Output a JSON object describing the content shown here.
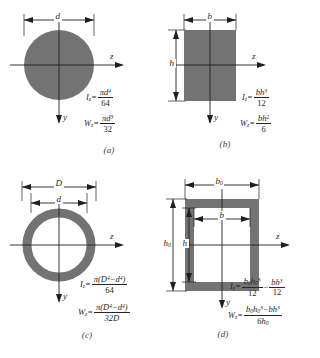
{
  "figure": {
    "fill_color": "#737373",
    "line_color": "#1f1f1f",
    "background_color": "#ffffff"
  },
  "panels": [
    {
      "id": "a",
      "caption": "(a)",
      "shape": "solid-circle",
      "dimensions": [
        {
          "name": "diameter",
          "label": "d",
          "orientation": "horizontal"
        }
      ],
      "axes": [
        {
          "name": "z-axis",
          "label": "z",
          "direction": "right"
        },
        {
          "name": "y-axis",
          "label": "y",
          "direction": "down"
        }
      ],
      "formulas": [
        {
          "name": "moment-of-inertia",
          "lhs": "I",
          "lhs_sub": "z",
          "numerator": "πd",
          "numerator_sup": "4",
          "denominator": "64"
        },
        {
          "name": "section-modulus",
          "lhs": "W",
          "lhs_sub": "z",
          "numerator": "πd",
          "numerator_sup": "3",
          "denominator": "32"
        }
      ]
    },
    {
      "id": "b",
      "caption": "(b)",
      "shape": "solid-rectangle",
      "dimensions": [
        {
          "name": "width",
          "label": "b",
          "orientation": "horizontal"
        },
        {
          "name": "height",
          "label": "h",
          "orientation": "vertical"
        }
      ],
      "axes": [
        {
          "name": "z-axis",
          "label": "z",
          "direction": "right"
        },
        {
          "name": "y-axis",
          "label": "y",
          "direction": "down"
        }
      ],
      "formulas": [
        {
          "name": "moment-of-inertia",
          "lhs": "I",
          "lhs_sub": "z",
          "numerator": "bh",
          "numerator_sup": "3",
          "denominator": "12"
        },
        {
          "name": "section-modulus",
          "lhs": "W",
          "lhs_sub": "z",
          "numerator": "bh",
          "numerator_sup": "2",
          "denominator": "6"
        }
      ]
    },
    {
      "id": "c",
      "caption": "(c)",
      "shape": "hollow-circle",
      "dimensions": [
        {
          "name": "outer-diameter",
          "label": "D",
          "orientation": "horizontal"
        },
        {
          "name": "inner-diameter",
          "label": "d",
          "orientation": "horizontal"
        }
      ],
      "axes": [
        {
          "name": "z-axis",
          "label": "z",
          "direction": "right"
        },
        {
          "name": "y-axis",
          "label": "y",
          "direction": "down"
        }
      ],
      "formulas": [
        {
          "name": "moment-of-inertia",
          "lhs": "I",
          "lhs_sub": "z",
          "numerator_parts": [
            "π(D",
            "4",
            "−d",
            "4",
            ")"
          ],
          "denominator": "64"
        },
        {
          "name": "section-modulus",
          "lhs": "W",
          "lhs_sub": "z",
          "numerator_parts": [
            "π(D",
            "4",
            "−d",
            "4",
            ")"
          ],
          "denominator": "32D"
        }
      ]
    },
    {
      "id": "d",
      "caption": "(d)",
      "shape": "hollow-rectangle",
      "dimensions": [
        {
          "name": "outer-width",
          "label": "b",
          "label_sub": "0",
          "orientation": "horizontal"
        },
        {
          "name": "inner-width",
          "label": "b",
          "orientation": "horizontal"
        },
        {
          "name": "outer-height",
          "label": "h",
          "label_sub": "0",
          "orientation": "vertical"
        },
        {
          "name": "inner-height",
          "label": "h",
          "orientation": "vertical"
        }
      ],
      "axes": [
        {
          "name": "z-axis",
          "label": "z",
          "direction": "right"
        },
        {
          "name": "y-axis",
          "label": "y",
          "direction": "down"
        }
      ],
      "formulas": [
        {
          "name": "moment-of-inertia",
          "lhs": "I",
          "lhs_sub": "z",
          "term1_num": "b",
          "term1_num_sub": "0",
          "term1_num2": "h",
          "term1_num2_sub": "0",
          "term1_num2_sup": "3",
          "term1_den": "12",
          "operator": "−",
          "term2_num": "bh",
          "term2_num_sup": "3",
          "term2_den": "12"
        },
        {
          "name": "section-modulus",
          "lhs": "W",
          "lhs_sub": "z",
          "numerator_b0": "b",
          "numerator_b0_sub": "0",
          "numerator_h0": "h",
          "numerator_h0_sub": "0",
          "numerator_h0_sup": "3",
          "numerator_minus": "−bh",
          "numerator_minus_sup": "3",
          "denominator_d": "6h",
          "denominator_d_sub": "0"
        }
      ]
    }
  ]
}
